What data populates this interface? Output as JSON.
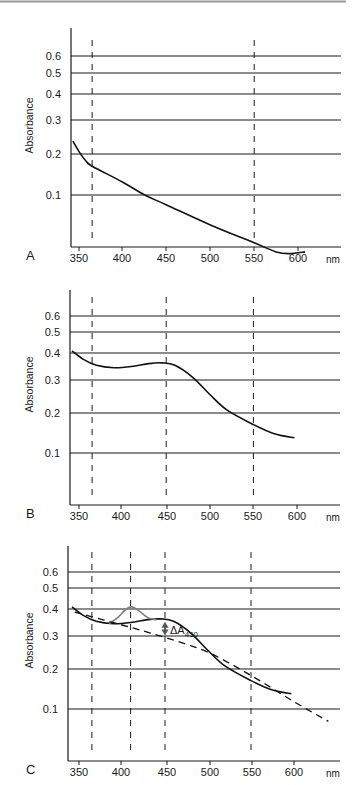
{
  "figure": {
    "panels": [
      "A",
      "B",
      "C"
    ],
    "x_unit": "nm",
    "y_label": "Absorbance",
    "annotation_c": {
      "delta": "ΔA",
      "subscript": "450"
    }
  },
  "colors": {
    "axis": "#1a1a1a",
    "curve": "#111111",
    "peak_curve": "#7f7f7f",
    "baseline": "#111111",
    "top_rule": "#9a9a9a"
  },
  "chart_data": [
    {
      "panel": "A",
      "type": "line",
      "title": "",
      "xlabel": "nm",
      "ylabel": "Absorbance",
      "yscale": "log",
      "ylim": [
        0.05,
        0.7
      ],
      "xlim": [
        340,
        645
      ],
      "x_ticks": [
        350,
        400,
        450,
        500,
        550,
        600
      ],
      "y_ticks": [
        0.1,
        0.2,
        0.3,
        0.4,
        0.5,
        0.6
      ],
      "grid": "horizontal at y ticks",
      "reference_lines_nm": [
        365,
        550
      ],
      "series": [
        {
          "name": "spectrum",
          "x": [
            343,
            350,
            358,
            365,
            400,
            425,
            450,
            500,
            550,
            575,
            590,
            608
          ],
          "values": [
            0.2,
            0.175,
            0.155,
            0.145,
            0.118,
            0.1,
            0.088,
            0.068,
            0.054,
            0.048,
            0.047,
            0.048
          ]
        }
      ]
    },
    {
      "panel": "B",
      "type": "line",
      "title": "",
      "xlabel": "nm",
      "ylabel": "Absorbance",
      "yscale": "log",
      "ylim": [
        0.05,
        0.7
      ],
      "xlim": [
        340,
        645
      ],
      "x_ticks": [
        350,
        400,
        450,
        500,
        550,
        600
      ],
      "y_ticks": [
        0.1,
        0.2,
        0.3,
        0.4,
        0.5,
        0.6
      ],
      "grid": "horizontal at y ticks",
      "reference_lines_nm": [
        365,
        450,
        550
      ],
      "series": [
        {
          "name": "spectrum",
          "x": [
            342,
            355,
            370,
            390,
            410,
            430,
            445,
            460,
            480,
            500,
            520,
            550,
            575,
            597
          ],
          "values": [
            0.38,
            0.34,
            0.315,
            0.305,
            0.31,
            0.322,
            0.325,
            0.315,
            0.27,
            0.215,
            0.175,
            0.145,
            0.128,
            0.122
          ]
        }
      ]
    },
    {
      "panel": "C",
      "type": "line",
      "title": "",
      "xlabel": "nm",
      "ylabel": "Absorbance",
      "yscale": "log",
      "ylim": [
        0.05,
        0.7
      ],
      "xlim": [
        340,
        645
      ],
      "x_ticks": [
        350,
        400,
        450,
        500,
        550,
        600
      ],
      "y_ticks": [
        0.1,
        0.2,
        0.3,
        0.4,
        0.5,
        0.6
      ],
      "grid": "horizontal at y ticks",
      "reference_lines_nm": [
        365,
        410,
        450,
        550
      ],
      "annotations": [
        {
          "text": "ΔA450",
          "x": 450,
          "type": "double-arrow between curve and baseline"
        }
      ],
      "series": [
        {
          "name": "spectrum",
          "color": "#111111",
          "x": [
            342,
            355,
            370,
            390,
            410,
            430,
            445,
            460,
            480,
            500,
            520,
            550,
            575,
            597
          ],
          "values": [
            0.38,
            0.34,
            0.315,
            0.305,
            0.31,
            0.322,
            0.325,
            0.315,
            0.27,
            0.215,
            0.175,
            0.145,
            0.128,
            0.122
          ]
        },
        {
          "name": "spectrum with peak",
          "color": "#7f7f7f",
          "x": [
            385,
            395,
            405,
            412,
            420,
            430,
            440
          ],
          "values": [
            0.305,
            0.33,
            0.37,
            0.38,
            0.36,
            0.33,
            0.322
          ]
        },
        {
          "name": "baseline",
          "style": "dashed",
          "x": [
            345,
            400,
            450,
            500,
            550,
            600,
            640
          ],
          "values": [
            0.355,
            0.3,
            0.255,
            0.21,
            0.155,
            0.11,
            0.085
          ]
        }
      ]
    }
  ]
}
